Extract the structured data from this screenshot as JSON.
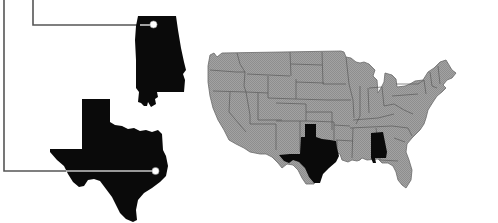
{
  "figure": {
    "colors": {
      "background": "#ffffff",
      "map_fill": "#9c9c9c",
      "map_border": "#5a5a5a",
      "highlight": "#0a0a0a",
      "leader_line": "#555555",
      "leader_line_on_shape": "#c8c8c8",
      "callout_dot": "#ffffff"
    },
    "highlighted_states": [
      "Texas",
      "Alabama"
    ],
    "callouts": [
      {
        "state": "Alabama",
        "icon": "alabama-silhouette-icon"
      },
      {
        "state": "Texas",
        "icon": "texas-silhouette-icon"
      }
    ]
  }
}
